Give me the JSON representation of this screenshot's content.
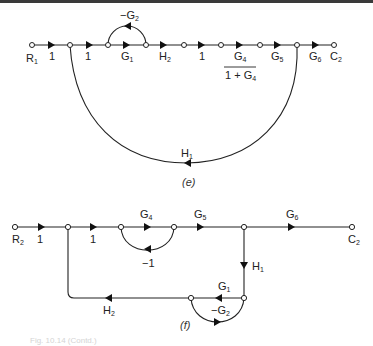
{
  "figure": {
    "caption_visible": "Fig. 10.14 (Contd.)",
    "diagram_e": {
      "label": "(e)",
      "input_node": {
        "name": "R",
        "sub": "1"
      },
      "output_node": {
        "name": "C",
        "sub": "2"
      },
      "forward_branches": [
        {
          "gain": "1"
        },
        {
          "gain": "1"
        },
        {
          "gain": "G",
          "sub": "1"
        },
        {
          "gain": "H",
          "sub": "2"
        },
        {
          "gain": "1"
        },
        {
          "gain_num": "G",
          "num_sub": "4",
          "gain_den": "1 + G",
          "den_sub": "4"
        },
        {
          "gain": "G",
          "sub": "5"
        },
        {
          "gain": "G",
          "sub": "6"
        }
      ],
      "self_loop": {
        "gain": "−G",
        "sub": "2"
      },
      "feedback_loop": {
        "gain": "H",
        "sub": "1"
      }
    },
    "diagram_f": {
      "label": "(f)",
      "input_node": {
        "name": "R",
        "sub": "2"
      },
      "output_node": {
        "name": "C",
        "sub": "2"
      },
      "forward_branches": [
        {
          "gain": "1"
        },
        {
          "gain": "1"
        },
        {
          "gain": "G",
          "sub": "4"
        },
        {
          "gain": "G",
          "sub": "5"
        },
        {
          "gain": "G",
          "sub": "6"
        }
      ],
      "inner_loop": {
        "gain": "−1"
      },
      "down_branch": {
        "gain": "H",
        "sub": "1"
      },
      "return_branch_1": {
        "gain": "G",
        "sub": "1"
      },
      "return_loop": {
        "gain": "−G",
        "sub": "2"
      },
      "return_branch_2": {
        "gain": "H",
        "sub": "2"
      }
    }
  }
}
